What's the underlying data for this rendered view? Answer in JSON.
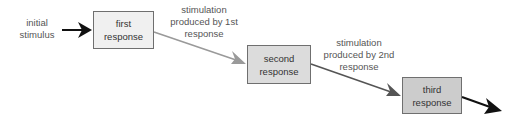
{
  "diagram": {
    "initial_stimulus": "initial\nstimulus",
    "boxes": [
      {
        "label_line1": "first",
        "label_line2": "response",
        "fill": "#f0f0f0"
      },
      {
        "label_line1": "second",
        "label_line2": "response",
        "fill": "#dcdcdc"
      },
      {
        "label_line1": "third",
        "label_line2": "response",
        "fill": "#cccccc"
      }
    ],
    "stimulations": [
      {
        "line1": "stimulation",
        "line2": "produced by 1st",
        "line3": "response"
      },
      {
        "line1": "stimulation",
        "line2": "produced by 2nd",
        "line3": "response"
      }
    ],
    "arrow_colors": {
      "initial": "#111111",
      "first_to_second": "#9a9a9a",
      "second_to_third": "#555555",
      "final": "#111111"
    }
  }
}
